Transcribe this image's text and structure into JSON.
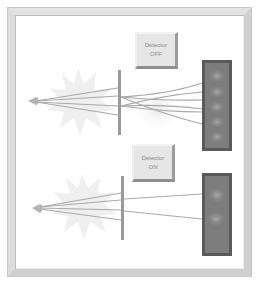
{
  "diagram": {
    "panels": [
      {
        "id": "top",
        "detector_button": {
          "line1": "Detector",
          "line2": "OFF"
        },
        "pattern": "interference",
        "screen_bands": 5
      },
      {
        "id": "bottom",
        "detector_button": {
          "line1": "Detector",
          "line2": "ON"
        },
        "pattern": "two-band",
        "screen_bands": 2
      }
    ],
    "colors": {
      "frame": "#dcdcdc",
      "screen_fill": "#7d7d7d",
      "screen_border": "#4a4a4a",
      "ray": "#a8a8a8",
      "barrier": "#9a9a9a",
      "burst": "#efefef",
      "button_face": "#e6e6e6",
      "button_text": "#8a8a8a"
    }
  }
}
